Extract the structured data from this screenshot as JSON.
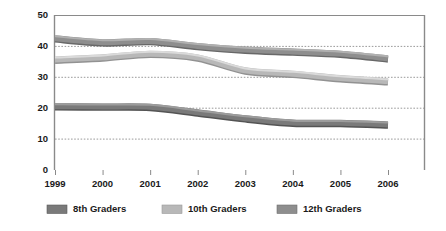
{
  "chart_data": {
    "type": "line",
    "title": "",
    "xlabel": "",
    "ylabel": "",
    "categories": [
      "1999",
      "2000",
      "2001",
      "2002",
      "2003",
      "2004",
      "2005",
      "2006"
    ],
    "x": [
      1999,
      2000,
      2001,
      2002,
      2003,
      2004,
      2005,
      2006
    ],
    "xlim": [
      1999,
      2006
    ],
    "ylim": [
      0,
      50
    ],
    "yticks": [
      0,
      10,
      20,
      30,
      40,
      50
    ],
    "ytick_labels": [
      "0",
      "10",
      "20",
      "30",
      "40",
      "50"
    ],
    "xtick_labels": [
      "1999",
      "2000",
      "2001",
      "2002",
      "2003",
      "2004",
      "2005",
      "2006"
    ],
    "grid": "horizontal-dotted",
    "gridlines": [
      10,
      20,
      30,
      40
    ],
    "legend_position": "bottom",
    "series": [
      {
        "name": "8th Graders",
        "color": "#7a7a7a",
        "values": [
          20.5,
          20.4,
          20.3,
          18.5,
          16.6,
          15.2,
          15.1,
          14.6
        ]
      },
      {
        "name": "10th Graders",
        "color": "#b8b8b8",
        "values": [
          35.6,
          36.3,
          37.5,
          36.3,
          32.1,
          31.0,
          29.6,
          28.6
        ]
      },
      {
        "name": "12th Graders",
        "color": "#8e8e8e",
        "values": [
          42.5,
          41.2,
          41.6,
          40.0,
          38.8,
          38.2,
          37.5,
          36.0
        ]
      }
    ]
  },
  "axis": {
    "y_labels": [
      "50",
      "40",
      "30",
      "20",
      "10",
      "0"
    ],
    "x_labels": [
      "1999",
      "2000",
      "2001",
      "2002",
      "2003",
      "2004",
      "2005",
      "2006"
    ]
  },
  "legend": {
    "items": [
      {
        "label": "8th Graders",
        "color": "#7a7a7a"
      },
      {
        "label": "10th Graders",
        "color": "#b8b8b8"
      },
      {
        "label": "12th Graders",
        "color": "#8e8e8e"
      }
    ]
  },
  "colors": {
    "axis": "#8a8a8a",
    "grid": "#9a9a9a",
    "text": "#1a1a1a",
    "background": "#ffffff"
  }
}
